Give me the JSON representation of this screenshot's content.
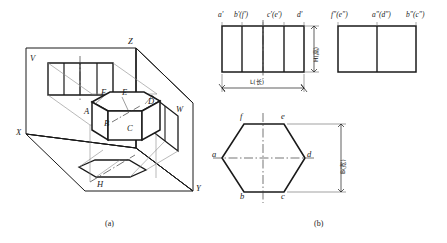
{
  "figure": {
    "title_a": "(a)",
    "title_b": "(b)"
  },
  "pictorial": {
    "plane_labels": [
      {
        "name": "V",
        "text": "V"
      },
      {
        "name": "W",
        "text": "W"
      },
      {
        "name": "H",
        "text": "H"
      }
    ],
    "axis_labels": [
      {
        "name": "Z",
        "text": "Z"
      },
      {
        "name": "X",
        "text": "X"
      },
      {
        "name": "Y",
        "text": "Y"
      }
    ],
    "vertex_labels": [
      {
        "name": "A",
        "text": "A"
      },
      {
        "name": "B",
        "text": "B"
      },
      {
        "name": "C",
        "text": "C"
      },
      {
        "name": "D",
        "text": "D"
      },
      {
        "name": "E",
        "text": "E"
      },
      {
        "name": "F",
        "text": "F"
      }
    ]
  },
  "views": {
    "front_view_labels": [
      "a'",
      "b'(f')",
      "c'(e')",
      "d'"
    ],
    "side_view_labels": [
      "f\"(e\")",
      "a\"(d\")",
      "b\"(c\")"
    ],
    "top_view_labels": [
      "f",
      "e",
      "a",
      "d",
      "b",
      "c"
    ],
    "dimensions": [
      {
        "name": "height",
        "symbol": "H",
        "cn": "(高)",
        "text": "H(高)"
      },
      {
        "name": "length",
        "symbol": "L",
        "cn": "(长)",
        "text": "L(长)"
      },
      {
        "name": "width",
        "symbol": "B",
        "cn": "(宽)",
        "text": "B(宽)"
      }
    ]
  },
  "colors": {
    "line": "#1a1a1a",
    "thin": "#6b6b6b",
    "background": "#ffffff"
  }
}
